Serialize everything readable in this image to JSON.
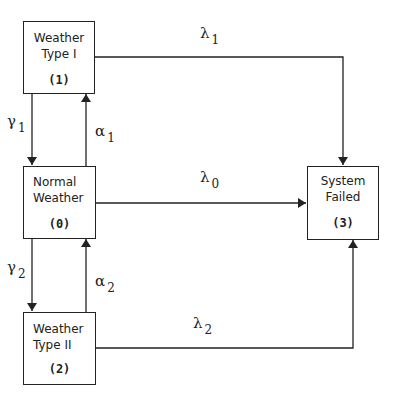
{
  "diagram": {
    "type": "state-transition",
    "states": [
      {
        "id": "1",
        "label_line1": "Weather",
        "label_line2": "Type I",
        "number": "(1)"
      },
      {
        "id": "0",
        "label_line1": "Normal",
        "label_line2": "Weather",
        "number": "(0)"
      },
      {
        "id": "2",
        "label_line1": "Weather",
        "label_line2": "Type II",
        "number": "(2)"
      },
      {
        "id": "3",
        "label_line1": "System",
        "label_line2": "Failed",
        "number": "(3)"
      }
    ],
    "transitions": [
      {
        "from": "1",
        "to": "3",
        "symbol": "λ",
        "sub": "1"
      },
      {
        "from": "0",
        "to": "3",
        "symbol": "λ",
        "sub": "0"
      },
      {
        "from": "2",
        "to": "3",
        "symbol": "λ",
        "sub": "2"
      },
      {
        "from": "1",
        "to": "0",
        "symbol": "γ",
        "sub": "1"
      },
      {
        "from": "0",
        "to": "1",
        "symbol": "α",
        "sub": "1"
      },
      {
        "from": "0",
        "to": "2",
        "symbol": "γ",
        "sub": "2"
      },
      {
        "from": "2",
        "to": "0",
        "symbol": "α",
        "sub": "2"
      }
    ]
  }
}
